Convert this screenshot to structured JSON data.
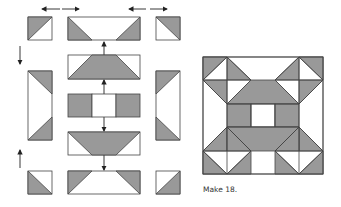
{
  "figure": {
    "type": "quilt-block-assembly-diagram",
    "caption": "Make 18.",
    "colors": {
      "gray": "#999999",
      "white": "#ffffff",
      "outline": "#444444",
      "arrow": "#222222"
    }
  },
  "assembly": {
    "rows": [
      {
        "name": "top-row",
        "units": [
          "half-square-triangle",
          "flying-geese-rectangle",
          "half-square-triangle"
        ]
      },
      {
        "name": "middle-section",
        "units": [
          "side-rectangle",
          "center-column",
          "side-rectangle"
        ]
      },
      {
        "name": "bottom-row",
        "units": [
          "half-square-triangle",
          "flying-geese-rectangle",
          "half-square-triangle"
        ]
      }
    ],
    "center_column": [
      "inverted-geese-rectangle-top",
      "trapezoid-rectangle",
      "gray-white-gray-strip",
      "trapezoid-rectangle-inverted",
      "inverted-geese-rectangle-bottom"
    ],
    "arrows": [
      "left-right-top-left",
      "left-right-top-right",
      "down-left",
      "up-left",
      "up-center-1",
      "up-center-2",
      "down-center-1",
      "down-center-2"
    ]
  },
  "finished_block": {
    "grid": "5x5",
    "description": "Finished block"
  }
}
